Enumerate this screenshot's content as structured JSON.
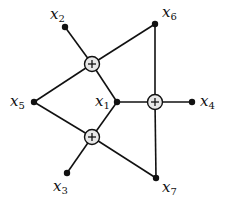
{
  "diagram": {
    "colors": {
      "stroke": "#111111",
      "sum_fill": "#e8e8e8",
      "background": "#ffffff"
    },
    "nodes": [
      {
        "id": "x1",
        "var": "x",
        "sub": "1",
        "x": 117,
        "y": 102
      },
      {
        "id": "x2",
        "var": "x",
        "sub": "2",
        "x": 65,
        "y": 27
      },
      {
        "id": "x3",
        "var": "x",
        "sub": "3",
        "x": 67,
        "y": 173
      },
      {
        "id": "x4",
        "var": "x",
        "sub": "4",
        "x": 192,
        "y": 102
      },
      {
        "id": "x5",
        "var": "x",
        "sub": "5",
        "x": 34,
        "y": 102
      },
      {
        "id": "x6",
        "var": "x",
        "sub": "6",
        "x": 155,
        "y": 24
      },
      {
        "id": "x7",
        "var": "x",
        "sub": "7",
        "x": 156,
        "y": 178
      }
    ],
    "sum_nodes": [
      {
        "id": "plus-top",
        "symbol": "+",
        "x": 92,
        "y": 64
      },
      {
        "id": "plus-right",
        "symbol": "+",
        "x": 155,
        "y": 102
      },
      {
        "id": "plus-bottom",
        "symbol": "+",
        "x": 92,
        "y": 137
      }
    ],
    "edges": [
      [
        "x2",
        "plus-top"
      ],
      [
        "plus-top",
        "x6"
      ],
      [
        "plus-top",
        "x5"
      ],
      [
        "plus-top",
        "x1"
      ],
      [
        "x5",
        "plus-bottom"
      ],
      [
        "plus-bottom",
        "x1"
      ],
      [
        "plus-bottom",
        "x3"
      ],
      [
        "plus-bottom",
        "x7"
      ],
      [
        "x1",
        "plus-right"
      ],
      [
        "plus-right",
        "x4"
      ],
      [
        "x6",
        "plus-right"
      ],
      [
        "plus-right",
        "x7"
      ]
    ],
    "labels": {
      "x1": {
        "var": "x",
        "sub": "1"
      },
      "x2": {
        "var": "x",
        "sub": "2"
      },
      "x3": {
        "var": "x",
        "sub": "3"
      },
      "x4": {
        "var": "x",
        "sub": "4"
      },
      "x5": {
        "var": "x",
        "sub": "5"
      },
      "x6": {
        "var": "x",
        "sub": "6"
      },
      "x7": {
        "var": "x",
        "sub": "7"
      },
      "plus": "+"
    }
  }
}
